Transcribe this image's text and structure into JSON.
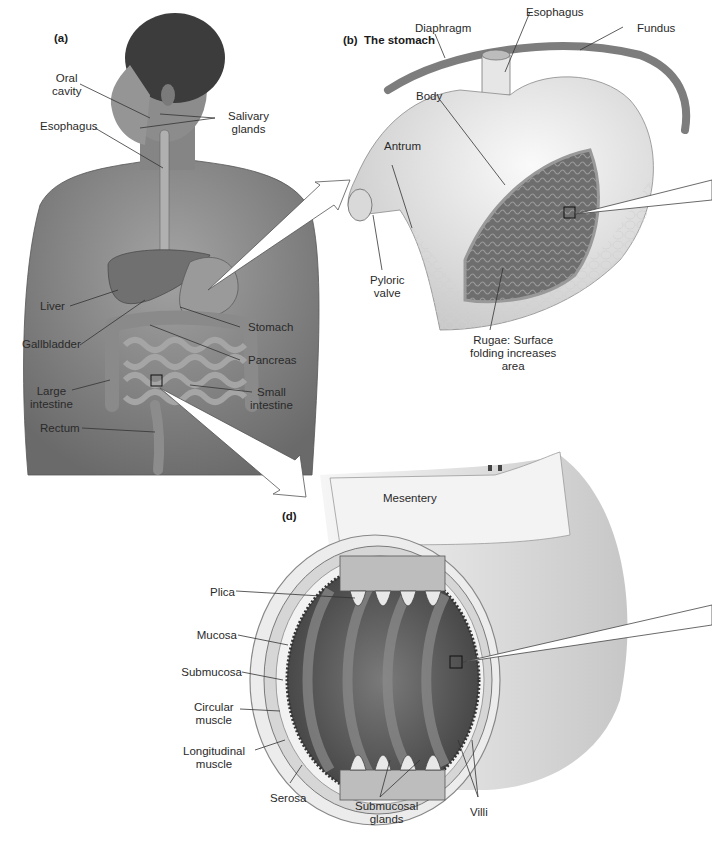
{
  "figure": {
    "panels": {
      "a": {
        "tag": "(a)"
      },
      "b": {
        "tag": "(b)",
        "title": "The stomach"
      },
      "d": {
        "tag": "(d)"
      }
    },
    "body_labels": {
      "oral_cavity": [
        "Oral",
        "cavity"
      ],
      "esophagus": "Esophagus",
      "salivary_glands": [
        "Salivary",
        "glands"
      ],
      "liver": "Liver",
      "gallbladder": "Gallbladder",
      "stomach": "Stomach",
      "pancreas": "Pancreas",
      "large_intestine": [
        "Large",
        "intestine"
      ],
      "small_intestine": [
        "Small",
        "intestine"
      ],
      "rectum": "Rectum"
    },
    "stomach_labels": {
      "diaphragm": "Diaphragm",
      "esophagus": "Esophagus",
      "fundus": "Fundus",
      "body": "Body",
      "antrum": "Antrum",
      "pyloric_valve": [
        "Pyloric",
        "valve"
      ],
      "rugae": [
        "Rugae: Surface",
        "folding increases",
        "area"
      ]
    },
    "intestine_labels": {
      "mesentery": "Mesentery",
      "plica": "Plica",
      "mucosa": "Mucosa",
      "submucosa": "Submucosa",
      "circular_muscle": [
        "Circular",
        "muscle"
      ],
      "longitudinal_muscle": [
        "Longitudinal",
        "muscle"
      ],
      "serosa": "Serosa",
      "submucosal_glands": [
        "Submucosal",
        "glands"
      ],
      "villi": "Villi"
    },
    "colors": {
      "skin": "#8a8a8a",
      "skin_dark": "#5e5e5e",
      "hair": "#3a3a3a",
      "organ": "#9c9c9c",
      "stomach_wall": "#e6e6e6",
      "rugae": "#6f6f6f",
      "lumen": "#4f4f4f",
      "line": "#333333"
    }
  }
}
